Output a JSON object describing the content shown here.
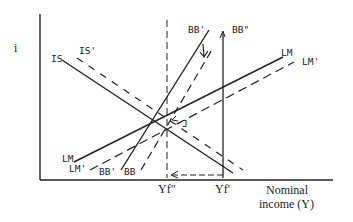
{
  "diagram": {
    "type": "IS-LM-BB",
    "y_axis_label": "i",
    "x_axis_label_line1": "Nominal",
    "x_axis_label_line2": "income (Y)",
    "curves": {
      "is": "IS",
      "is_prime": "IS'",
      "lm": "LM",
      "lm_prime": "LM'",
      "bb": "BB",
      "bb_prime_bottom": "BB'",
      "bb_prime_top": "BB'",
      "bb_double_prime": "BB\""
    },
    "ticks": {
      "yf_double_prime": "Yf\"",
      "yf_prime": "Yf'"
    },
    "point_label": "J",
    "colors": {
      "ink": "#222222",
      "background": "#ffffff"
    }
  }
}
